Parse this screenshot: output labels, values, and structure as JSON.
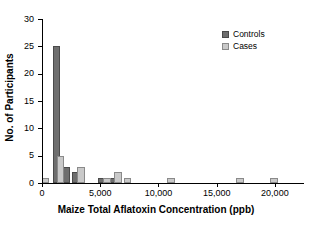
{
  "chart_data": {
    "type": "bar",
    "title": "",
    "xlabel": "Maize Total Aflatoxin Concentration (ppb)",
    "ylabel": "No. of Participants",
    "xlim": [
      0,
      22500
    ],
    "ylim": [
      0,
      30
    ],
    "grid": false,
    "legend_position": "top-right",
    "x_tick_labels": [
      "0",
      "5,000",
      "10,000",
      "15,000",
      "20,000"
    ],
    "x_tick_values": [
      0,
      5000,
      10000,
      15000,
      20000
    ],
    "y_tick_labels": [
      "0",
      "5",
      "10",
      "15",
      "20",
      "25",
      "30"
    ],
    "y_tick_values": [
      0,
      5,
      10,
      15,
      20,
      25,
      30
    ],
    "bin_width": 750,
    "series": [
      {
        "name": "Controls",
        "color": "#6e6e6e",
        "points": [
          {
            "x": 1250,
            "value": 25
          },
          {
            "x": 2050,
            "value": 3
          },
          {
            "x": 2950,
            "value": 2
          },
          {
            "x": 5150,
            "value": 1
          },
          {
            "x": 6150,
            "value": 1
          }
        ]
      },
      {
        "name": "Cases",
        "color": "#c9c9c9",
        "points": [
          {
            "x": 300,
            "value": 1
          },
          {
            "x": 1600,
            "value": 5
          },
          {
            "x": 3350,
            "value": 3
          },
          {
            "x": 5600,
            "value": 1
          },
          {
            "x": 6550,
            "value": 2
          },
          {
            "x": 7350,
            "value": 1
          },
          {
            "x": 11100,
            "value": 1
          },
          {
            "x": 17000,
            "value": 1
          },
          {
            "x": 19900,
            "value": 1
          }
        ]
      }
    ]
  },
  "legend": {
    "items": [
      {
        "label": "Controls",
        "key": "controls"
      },
      {
        "label": "Cases",
        "key": "cases"
      }
    ]
  }
}
